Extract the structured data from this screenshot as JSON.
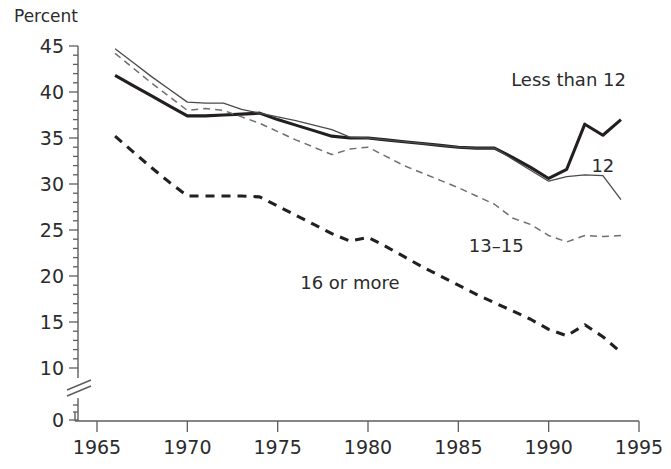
{
  "figure": {
    "y_axis_title": "Percent",
    "background_color": "#ffffff",
    "line_color": "#231f20",
    "light_line_color": "#6f6f6f"
  },
  "chart_data": {
    "type": "line",
    "title": "",
    "xlabel": "",
    "ylabel": "Percent",
    "xlim": [
      1965,
      1995
    ],
    "ylim": [
      0,
      45
    ],
    "y_axis_break": true,
    "y_axis_break_between": [
      0,
      10
    ],
    "grid": false,
    "legend_position": "inline-labels",
    "xticks": [
      1965,
      1970,
      1975,
      1980,
      1985,
      1990,
      1995
    ],
    "xtick_labels": [
      "1965",
      "1970",
      "1975",
      "1980",
      "1985",
      "1990",
      "1995"
    ],
    "yticks": [
      0,
      10,
      15,
      20,
      25,
      30,
      35,
      40,
      45
    ],
    "ytick_labels": [
      "0",
      "10",
      "15",
      "20",
      "25",
      "30",
      "35",
      "40",
      "45"
    ],
    "minor_y_tick_step": 1,
    "x": [
      1966,
      1967,
      1968,
      1969,
      1970,
      1971,
      1972,
      1973,
      1974,
      1975,
      1976,
      1977,
      1978,
      1979,
      1980,
      1981,
      1982,
      1983,
      1984,
      1985,
      1986,
      1987,
      1988,
      1989,
      1990,
      1991,
      1992,
      1993,
      1994
    ],
    "series": [
      {
        "name": "Less than 12",
        "label": "Less  than 12",
        "style": "solid-bold",
        "color": "#231f20",
        "label_x": 1991.1,
        "label_y": 40.6,
        "values": [
          41.8,
          40.7,
          39.6,
          38.5,
          37.4,
          37.4,
          37.5,
          37.6,
          37.7,
          37.0,
          36.4,
          35.8,
          35.2,
          35.0,
          35.0,
          34.8,
          34.6,
          34.4,
          34.2,
          34.0,
          33.9,
          33.9,
          32.9,
          31.8,
          30.6,
          31.6,
          36.5,
          35.3,
          37.0
        ]
      },
      {
        "name": "12",
        "label": "12",
        "style": "solid-thin",
        "color": "#4a4a4a",
        "label_x": 1993.0,
        "label_y": 31.3,
        "values": [
          44.7,
          43.2,
          41.7,
          40.3,
          38.9,
          38.8,
          38.8,
          38.1,
          37.7,
          37.3,
          36.9,
          36.4,
          35.9,
          35.1,
          35.0,
          34.8,
          34.6,
          34.4,
          34.2,
          34.0,
          33.9,
          33.9,
          32.7,
          31.5,
          30.3,
          30.8,
          31.0,
          30.9,
          28.3
        ]
      },
      {
        "name": "13-15",
        "label": "13–15",
        "style": "dashed-thin",
        "color": "#6f6f6f",
        "label_x": 1987.1,
        "label_y": 22.6,
        "values": [
          44.2,
          42.6,
          41.0,
          39.5,
          38.0,
          38.2,
          38.0,
          37.3,
          36.6,
          35.7,
          34.8,
          34.0,
          33.2,
          33.8,
          34.0,
          33.0,
          32.0,
          31.2,
          30.4,
          29.6,
          28.7,
          27.8,
          26.3,
          25.6,
          24.4,
          23.7,
          24.4,
          24.3,
          24.4
        ]
      },
      {
        "name": "16 or more",
        "label": "16 or more",
        "style": "dashed-bold",
        "color": "#231f20",
        "label_x": 1979.0,
        "label_y": 18.6,
        "values": [
          35.2,
          33.5,
          31.8,
          30.2,
          28.7,
          28.7,
          28.7,
          28.7,
          28.6,
          27.6,
          26.6,
          25.6,
          24.6,
          23.8,
          24.2,
          23.2,
          22.1,
          21.0,
          20.0,
          19.0,
          18.0,
          17.1,
          16.2,
          15.3,
          14.2,
          13.5,
          14.7,
          13.4,
          11.7
        ]
      }
    ]
  }
}
